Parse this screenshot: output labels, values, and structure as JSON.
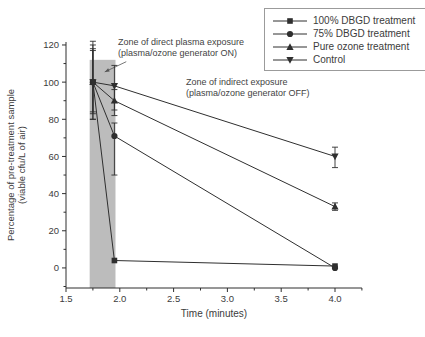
{
  "figure": {
    "stroke_color": "#2f2f2f",
    "text_color": "#3c3c3c",
    "background": "#ffffff"
  },
  "chart_data": {
    "type": "line",
    "title": "",
    "xlabel": "Time (minutes)",
    "ylabel_line1": "Percentage of pre-treatment sample",
    "ylabel_line2": "(viable cfu/L of air)",
    "xlim": [
      1.5,
      4.25
    ],
    "ylim": [
      -10.8,
      121.6
    ],
    "x_major_ticks": [
      1.5,
      2.0,
      2.5,
      3.0,
      3.5,
      4.0
    ],
    "x_minor_step": 0.25,
    "y_major_ticks": [
      0,
      20,
      40,
      60,
      80,
      100,
      120
    ],
    "y_minor_step": 10,
    "grid": false,
    "legend_position": "top-right",
    "series": [
      {
        "name": "100% DBGD treatment",
        "marker": "square",
        "points": [
          {
            "x": 1.75,
            "y": 100,
            "lo": 80,
            "hi": 120
          },
          {
            "x": 1.95,
            "y": 4
          },
          {
            "x": 4.0,
            "y": 1
          }
        ]
      },
      {
        "name": "75% DBGD treatment",
        "marker": "circle",
        "points": [
          {
            "x": 1.75,
            "y": 100,
            "lo": 83,
            "hi": 118
          },
          {
            "x": 1.95,
            "y": 71,
            "lo": 50,
            "hi": 78
          },
          {
            "x": 4.0,
            "y": 0
          }
        ]
      },
      {
        "name": "Pure ozone treatment",
        "marker": "triangle-up",
        "points": [
          {
            "x": 1.75,
            "y": 100,
            "lo": 84,
            "hi": 117
          },
          {
            "x": 1.95,
            "y": 90,
            "lo": 85,
            "hi": 96
          },
          {
            "x": 4.0,
            "y": 33,
            "lo": 31,
            "hi": 35
          }
        ]
      },
      {
        "name": "Control",
        "marker": "triangle-down",
        "points": [
          {
            "x": 1.75,
            "y": 100,
            "lo": 80,
            "hi": 122
          },
          {
            "x": 1.95,
            "y": 98,
            "lo": 82,
            "hi": 109
          },
          {
            "x": 4.0,
            "y": 60,
            "lo": 54,
            "hi": 65
          }
        ]
      }
    ],
    "shaded_zone": {
      "x0": 1.72,
      "x1": 1.96,
      "y_top": 112,
      "color": "#bcbcbc"
    },
    "annotations": [
      {
        "id": "direct-zone-note",
        "line1": "Zone of direct plasma exposure",
        "line2": "(plasma/ozone generator ON)",
        "arrow": {
          "from_x": 2.06,
          "from_y": 111,
          "to_x": 1.86,
          "to_y": 105.5
        }
      },
      {
        "id": "indirect-zone-note",
        "line1": "Zone of indirect exposure",
        "line2": "(plasma/ozone generator OFF)"
      }
    ]
  }
}
